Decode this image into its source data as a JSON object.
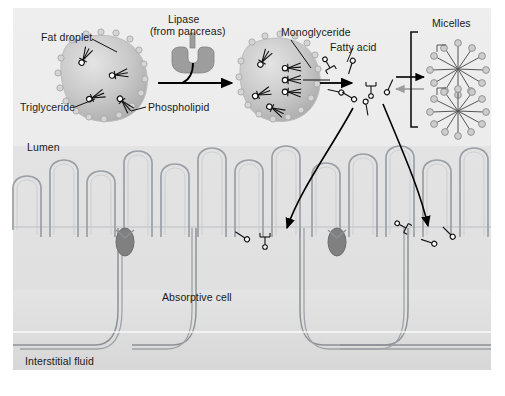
{
  "figure": {
    "background_color": "#ffffff",
    "panel_color": "#ececec"
  },
  "labels": {
    "fat_droplet": "Fat droplet",
    "triglyceride": "Triglyceride",
    "phospholipid": "Phospholipid",
    "lipase_line1": "Lipase",
    "lipase_line2": "(from pancreas)",
    "monoglyceride": "Monoglyceride",
    "fatty_acid": "Fatty acid",
    "micelles": "Micelles",
    "lumen": "Lumen",
    "absorptive_cell": "Absorptive cell",
    "interstitial_fluid": "Interstitial fluid"
  },
  "colors": {
    "droplet_fill": "#c9c9c9",
    "droplet_rim": "#d8d8d8",
    "membrane_line": "#8e9196",
    "tight_junction": "#7c7c7c",
    "arrow": "#000000",
    "text": "#1a1a1a",
    "lipase_body": "#9a9a9a",
    "lumen_bg": "#ececec",
    "cell_bg": "#dedede"
  },
  "diagram": {
    "type": "biological-process",
    "steps": [
      "Fat droplet composed of triglyceride coated with phospholipid",
      "Lipase from pancreas digests triglyceride",
      "Emulsified droplet yields monoglyceride and fatty acid",
      "Monoglycerides and fatty acids reversibly form micelles",
      "Lipids diffuse across microvilli into the absorptive cell"
    ],
    "microvilli_count": 12,
    "micelle_count": 2,
    "absorptive_cell_count": 2,
    "reversible_arrow": true
  }
}
